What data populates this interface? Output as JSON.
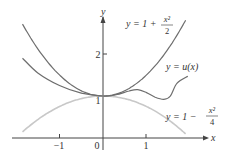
{
  "chart_data": {
    "type": "line",
    "title": "",
    "xlabel": "x",
    "ylabel": "y",
    "xlim": [
      -1.85,
      2.3
    ],
    "ylim": [
      0,
      2.6
    ],
    "x_ticks": [
      -1,
      0,
      1
    ],
    "x_tick_labels": [
      "−1",
      "0",
      "1"
    ],
    "y_ticks": [
      1,
      2
    ],
    "y_tick_labels": [
      "1",
      "2"
    ],
    "grid": false,
    "legend": "inline labels",
    "series": [
      {
        "name": "y = 1 + x^2/2",
        "label_parts": {
          "lhs": "y = 1 + ",
          "num": "x²",
          "den": "2"
        },
        "color": "#6e6e6e",
        "formula": "1 + x^2/2",
        "x": [
          -1.85,
          -1.5,
          -1,
          -0.5,
          0,
          0.5,
          1,
          1.5,
          1.9
        ],
        "y": [
          2.71,
          2.125,
          1.5,
          1.125,
          1.0,
          1.125,
          1.5,
          2.125,
          2.805
        ]
      },
      {
        "name": "y = u(x)",
        "label_parts": {
          "lhs": "y = ",
          "fn": "u(x)"
        },
        "color": "#6e6e6e",
        "x": [
          -1.85,
          -1.5,
          -1,
          -0.5,
          0,
          0.3,
          0.6,
          0.8,
          1.0,
          1.2,
          1.4,
          1.55,
          1.7,
          1.95
        ],
        "y": [
          1.9,
          1.55,
          1.25,
          1.07,
          1.0,
          1.03,
          1.12,
          1.15,
          1.08,
          0.97,
          0.92,
          1.0,
          1.3,
          1.47
        ]
      },
      {
        "name": "y = 1 − x^2/4",
        "label_parts": {
          "lhs": "y = 1 − ",
          "num": "x²",
          "den": "4"
        },
        "color": "#c8c8c8",
        "formula": "1 - x^2/4",
        "x": [
          -1.85,
          -1.5,
          -1,
          -0.5,
          0,
          0.5,
          1,
          1.5,
          1.9
        ],
        "y": [
          0.144,
          0.4375,
          0.75,
          0.9375,
          1.0,
          0.9375,
          0.75,
          0.4375,
          0.0975
        ]
      }
    ]
  }
}
